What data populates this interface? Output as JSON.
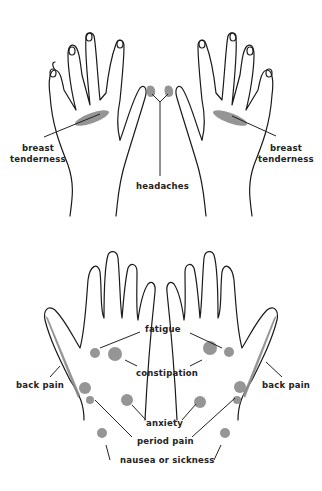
{
  "diagram": {
    "type": "hand reflexology chart",
    "colors": {
      "outline": "#1a1a1a",
      "spot": "#8a8a8a",
      "background": "#ffffff"
    },
    "back_of_hands": {
      "labels": {
        "left_breast": "breast\ntenderness",
        "left_breast_line1": "breast",
        "left_breast_line2": "tenderness",
        "right_breast_line1": "breast",
        "right_breast_line2": "tenderness",
        "headaches": "headaches"
      }
    },
    "palms": {
      "labels": {
        "fatigue": "fatigue",
        "constipation": "constipation",
        "back_pain_left": "back pain",
        "back_pain_right": "back pain",
        "anxiety": "anxiety",
        "period_pain": "period pain",
        "nausea": "nausea or sickness"
      }
    }
  }
}
